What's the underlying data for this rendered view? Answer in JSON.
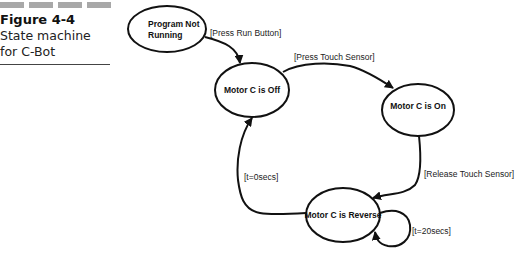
{
  "caption": {
    "figure_number": "Figure 4-4",
    "title_line1": "State machine",
    "title_line2": "for C-Bot"
  },
  "diagram": {
    "states": [
      {
        "id": "s0",
        "label_line1": "Program Not",
        "label_line2": "Running"
      },
      {
        "id": "s1",
        "label_line1": "Motor C is Off"
      },
      {
        "id": "s2",
        "label_line1": "Motor C is On"
      },
      {
        "id": "s3",
        "label_line1": "Motor C is Reverse"
      }
    ],
    "transitions": [
      {
        "from": "s0",
        "to": "s1",
        "label": "[Press Run Button]"
      },
      {
        "from": "s1",
        "to": "s2",
        "label": "[Press Touch Sensor]"
      },
      {
        "from": "s2",
        "to": "s3",
        "label": "[Release Touch Sensor]"
      },
      {
        "from": "s3",
        "to": "s1",
        "label": "[t=0secs]"
      },
      {
        "from": "s3",
        "to": "s3",
        "label": "[t=20secs]"
      }
    ]
  },
  "colors": {
    "stroke": "#111111",
    "caption_bars": "#a8a8a8"
  }
}
